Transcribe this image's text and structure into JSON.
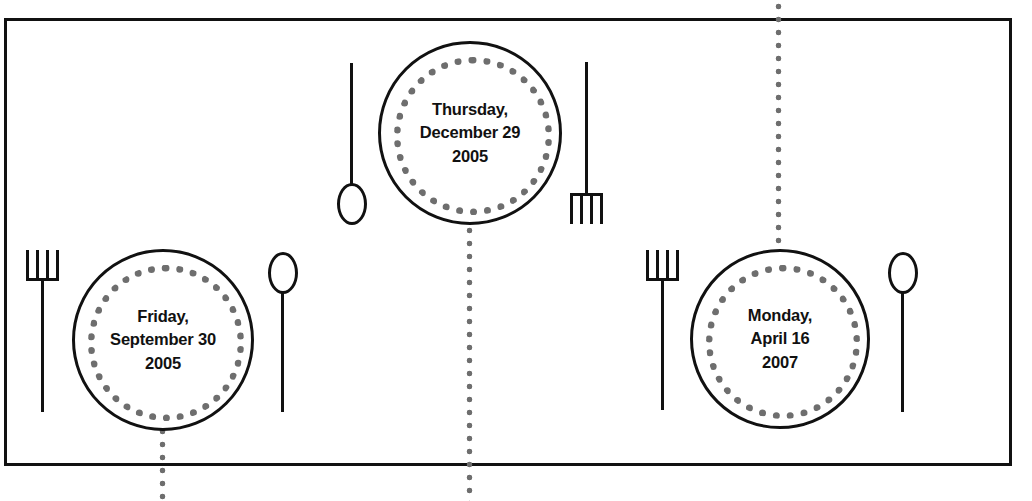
{
  "scene": {
    "title": "Place settings diagram",
    "background_color": "#ffffff",
    "line_color": "#111111",
    "dot_color": "#6e6e6e"
  },
  "table": {
    "label": "table-surface",
    "top": 18,
    "bottom": 463,
    "left": 4,
    "right": 1012
  },
  "place_settings": [
    {
      "id": "setting-left",
      "plate_label": "Friday,\nSeptember 30\n2005",
      "weekday": "Friday,",
      "date": "September 30",
      "year": "2005",
      "center_x": 163,
      "center_y": 340,
      "diameter": 182,
      "fork_side": "left",
      "spoon_side": "right",
      "fork_orientation": "tines-up",
      "spoon_orientation": "bowl-up",
      "connector": "below"
    },
    {
      "id": "setting-top",
      "plate_label": "Thursday,\nDecember 29\n2005",
      "weekday": "Thursday,",
      "date": "December 29",
      "year": "2005",
      "center_x": 470,
      "center_y": 133,
      "diameter": 184,
      "fork_side": "right",
      "spoon_side": "left",
      "fork_orientation": "tines-down",
      "spoon_orientation": "bowl-down",
      "connector": "below"
    },
    {
      "id": "setting-right",
      "plate_label": "Monday,\nApril 16\n2007",
      "weekday": "Monday,",
      "date": "April 16",
      "year": "2007",
      "center_x": 780,
      "center_y": 339,
      "diameter": 180,
      "fork_side": "left",
      "spoon_side": "right",
      "fork_orientation": "tines-up",
      "spoon_orientation": "bowl-up",
      "connector": "above"
    }
  ],
  "connectors": [
    {
      "id": "connector-left",
      "x": 163,
      "y_start": 425,
      "y_end": 501
    },
    {
      "id": "connector-mid",
      "x": 470,
      "y_start": 224,
      "y_end": 501
    },
    {
      "id": "connector-right",
      "x": 779,
      "y_start": 0,
      "y_end": 254
    }
  ]
}
